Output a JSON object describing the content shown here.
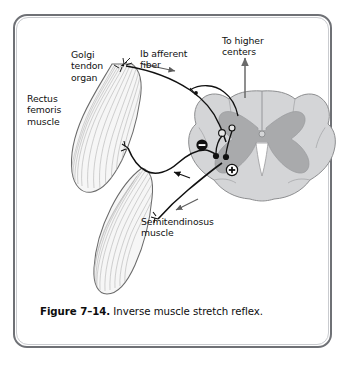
{
  "figure": {
    "caption_number": "Figure 7–14.",
    "caption_text": " Inverse muscle stretch reflex.",
    "labels": {
      "golgi_tendon_organ": "Golgi\ntendon\norgan",
      "rectus_femoris": "Rectus\nfemoris\nmuscle",
      "ib_afferent_fiber": "Ib afferent\nfiber",
      "to_higher_centers": "To higher\ncenters",
      "semitendinosus": "Semitendinosus\nmuscle"
    },
    "synapse_markers": {
      "inhibitory": "−",
      "excitatory": "+"
    },
    "colors": {
      "frame_outer": "#6f7176",
      "frame_inner": "#c9cbcf",
      "white_matter": "#d2d3d5",
      "gray_matter": "#a9aaac",
      "muscle_fill": "#f4f4f4",
      "muscle_stroke": "#6e6e6e",
      "nerve_stroke": "#111111",
      "text": "#111111",
      "page_background": "#ffffff"
    }
  }
}
